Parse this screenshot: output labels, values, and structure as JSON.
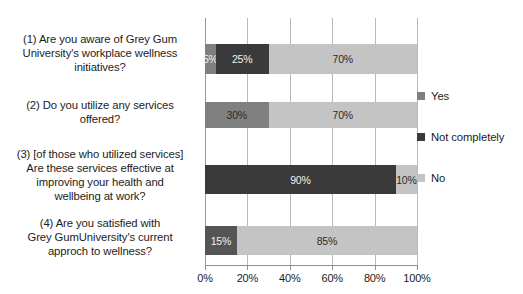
{
  "chart_data": {
    "type": "bar",
    "orientation": "horizontal",
    "stacked": true,
    "stack_mode": "percent",
    "title": "",
    "subtitle": "",
    "xlabel": "",
    "ylabel": "",
    "xlim": [
      0,
      100
    ],
    "xticks": [
      "0%",
      "20%",
      "40%",
      "60%",
      "80%",
      "100%"
    ],
    "xtick_values": [
      0,
      20,
      40,
      60,
      80,
      100
    ],
    "grid": true,
    "grid_axis": "x",
    "legend_position": "right",
    "categories": [
      "(1) Are you aware of Grey Gum University's workplace wellness initiatives?",
      "(2) Do you utilize any services offered?",
      "(3) [of those who utilized services] Are these services effective at improving your health and wellbeing at work?",
      "(4) Are you satisfied with Grey GumUniversity's current approch to wellness?"
    ],
    "series": [
      {
        "name": "Yes",
        "color": "#808080",
        "values": [
          5,
          30,
          0,
          15
        ]
      },
      {
        "name": "Not completely",
        "color": "#3a3a3a",
        "values": [
          25,
          0,
          90,
          0
        ]
      },
      {
        "name": "No",
        "color": "#c4c4c4",
        "values": [
          70,
          70,
          10,
          85
        ]
      }
    ],
    "bars": [
      {
        "category_index": 0,
        "segments": [
          {
            "series": "Yes",
            "value": 5,
            "label": "5%",
            "color": "#808080",
            "label_color": "light"
          },
          {
            "series": "Not completely",
            "value": 25,
            "label": "25%",
            "color": "#3a3a3a",
            "label_color": "light"
          },
          {
            "series": "No",
            "value": 70,
            "label": "70%",
            "color": "#c4c4c4",
            "label_color": "dark"
          }
        ]
      },
      {
        "category_index": 1,
        "segments": [
          {
            "series": "Yes",
            "value": 30,
            "label": "30%",
            "color": "#808080",
            "label_color": "dark"
          },
          {
            "series": "No",
            "value": 70,
            "label": "70%",
            "color": "#c4c4c4",
            "label_color": "dark"
          }
        ]
      },
      {
        "category_index": 2,
        "segments": [
          {
            "series": "Not completely",
            "value": 90,
            "label": "90%",
            "color": "#3a3a3a",
            "label_color": "light"
          },
          {
            "series": "No",
            "value": 10,
            "label": "10%",
            "color": "#c4c4c4",
            "label_color": "dark"
          }
        ]
      },
      {
        "category_index": 3,
        "segments": [
          {
            "series": "Yes",
            "value": 15,
            "label": "15%",
            "color": "#555555",
            "label_color": "light"
          },
          {
            "series": "No",
            "value": 85,
            "label": "85%",
            "color": "#c4c4c4",
            "label_color": "dark"
          }
        ]
      }
    ]
  },
  "categories": [
    {
      "id": "q1",
      "lines": [
        "(1) Are you aware of Grey Gum",
        "University's workplace wellness",
        "initiatives?"
      ],
      "top": 14,
      "height": 62,
      "bar_top": 26,
      "bar_height": 30
    },
    {
      "id": "q2",
      "lines": [
        "(2) Do you utilize any services",
        "offered?"
      ],
      "top": 80,
      "height": 44,
      "bar_top": 84,
      "bar_height": 26
    },
    {
      "id": "q3",
      "lines": [
        "(3) [of those who utilized services]",
        "Are these services effective at",
        "improving your health and",
        "wellbeing at work?"
      ],
      "top": 129,
      "height": 70,
      "bar_top": 147,
      "bar_height": 29
    },
    {
      "id": "q4",
      "lines": [
        "(4) Are you satisfied with",
        "Grey GumUniversity's current",
        "approch to wellness?"
      ],
      "top": 198,
      "height": 54,
      "bar_top": 208,
      "bar_height": 29
    }
  ],
  "legend": {
    "items": [
      {
        "label": "Yes",
        "color": "#808080"
      },
      {
        "label": "Not completely",
        "color": "#3a3a3a"
      },
      {
        "label": "No",
        "color": "#c4c4c4"
      }
    ]
  },
  "axis": {
    "ticks": [
      {
        "label": "0%",
        "value": 0
      },
      {
        "label": "20%",
        "value": 20
      },
      {
        "label": "40%",
        "value": 40
      },
      {
        "label": "60%",
        "value": 60
      },
      {
        "label": "80%",
        "value": 80
      },
      {
        "label": "100%",
        "value": 100
      }
    ]
  }
}
